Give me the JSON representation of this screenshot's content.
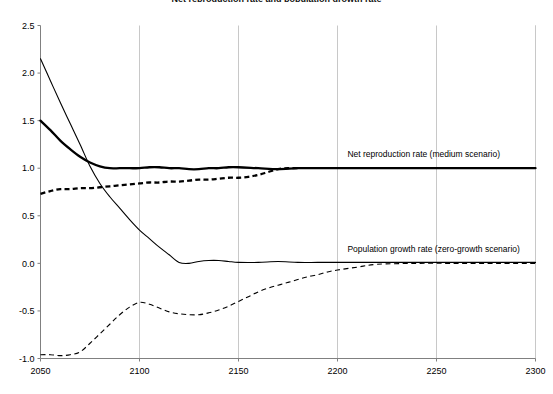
{
  "chart_data": {
    "type": "line",
    "title": "Net reproduction rate and population growth rate",
    "xlabel": "",
    "ylabel": "",
    "xlim": [
      2050,
      2300
    ],
    "ylim": [
      -1.0,
      2.5
    ],
    "xticks": [
      "2050",
      "2100",
      "2150",
      "2200",
      "2250",
      "2300"
    ],
    "xtick_values": [
      2050,
      2100,
      2150,
      2200,
      2250,
      2300
    ],
    "yticks": [
      "2.5",
      "2.0",
      "1.5",
      "1.0",
      "0.5",
      "0.0",
      "-0.5",
      "-1.0"
    ],
    "ytick_values": [
      2.5,
      2.0,
      1.5,
      1.0,
      0.5,
      0.0,
      -0.5,
      -1.0
    ],
    "grid": "vertical",
    "legend": "none",
    "annotations": [
      {
        "name": "net-reproduction-rate-label",
        "text": "Net reproduction rate (medium scenario)",
        "x": 2205,
        "y": 1.12
      },
      {
        "name": "population-growth-rate-label",
        "text": "Population growth rate (zero-growth scenario)",
        "x": 2205,
        "y": 0.12
      }
    ],
    "series": [
      {
        "name": "Net reproduction rate (medium scenario)",
        "style": "solid",
        "width": "thick",
        "color": "#000000",
        "x": [
          2050,
          2055,
          2060,
          2065,
          2070,
          2075,
          2080,
          2085,
          2090,
          2095,
          2100,
          2105,
          2110,
          2115,
          2120,
          2125,
          2130,
          2135,
          2140,
          2145,
          2150,
          2160,
          2170,
          2180,
          2190,
          2200,
          2220,
          2240,
          2260,
          2280,
          2300
        ],
        "values": [
          1.5,
          1.4,
          1.29,
          1.2,
          1.12,
          1.06,
          1.02,
          1.0,
          1.0,
          1.0,
          1.0,
          1.01,
          1.01,
          1.0,
          1.0,
          0.99,
          0.99,
          1.0,
          1.0,
          1.01,
          1.01,
          1.0,
          0.99,
          1.0,
          1.0,
          1.0,
          1.0,
          1.0,
          1.0,
          1.0,
          1.0
        ]
      },
      {
        "name": "Net reproduction rate (zero-growth scenario)",
        "style": "dashed",
        "width": "thick",
        "color": "#000000",
        "x": [
          2050,
          2055,
          2060,
          2065,
          2070,
          2075,
          2080,
          2085,
          2090,
          2095,
          2100,
          2105,
          2110,
          2115,
          2120,
          2125,
          2130,
          2135,
          2140,
          2145,
          2150,
          2155,
          2160,
          2165,
          2170,
          2175,
          2180
        ],
        "values": [
          0.73,
          0.76,
          0.78,
          0.78,
          0.79,
          0.79,
          0.8,
          0.81,
          0.82,
          0.83,
          0.84,
          0.85,
          0.85,
          0.86,
          0.86,
          0.87,
          0.88,
          0.88,
          0.89,
          0.9,
          0.9,
          0.91,
          0.93,
          0.96,
          0.99,
          1.0,
          1.0
        ]
      },
      {
        "name": "Population growth rate (medium scenario)",
        "style": "solid",
        "width": "thin",
        "color": "#000000",
        "x": [
          2050,
          2055,
          2060,
          2065,
          2070,
          2075,
          2080,
          2085,
          2090,
          2095,
          2100,
          2105,
          2110,
          2115,
          2120,
          2125,
          2130,
          2135,
          2140,
          2145,
          2150,
          2160,
          2170,
          2180,
          2190,
          2200,
          2220,
          2240,
          2260,
          2280,
          2300
        ],
        "values": [
          2.15,
          1.92,
          1.69,
          1.47,
          1.25,
          1.02,
          0.84,
          0.7,
          0.58,
          0.46,
          0.35,
          0.26,
          0.17,
          0.09,
          0.01,
          0.0,
          0.02,
          0.03,
          0.03,
          0.02,
          0.01,
          0.01,
          0.02,
          0.01,
          0.01,
          0.01,
          0.01,
          0.01,
          0.01,
          0.01,
          0.01
        ]
      },
      {
        "name": "Population growth rate (zero-growth scenario)",
        "style": "dashed",
        "width": "thin",
        "color": "#000000",
        "x": [
          2050,
          2055,
          2060,
          2065,
          2070,
          2075,
          2080,
          2085,
          2090,
          2095,
          2100,
          2105,
          2110,
          2115,
          2120,
          2125,
          2130,
          2135,
          2140,
          2145,
          2150,
          2155,
          2160,
          2165,
          2170,
          2175,
          2180,
          2185,
          2190,
          2195,
          2200,
          2210,
          2220,
          2240,
          2260,
          2280,
          2300
        ],
        "values": [
          -0.96,
          -0.96,
          -0.97,
          -0.96,
          -0.93,
          -0.84,
          -0.74,
          -0.64,
          -0.54,
          -0.46,
          -0.41,
          -0.43,
          -0.47,
          -0.51,
          -0.53,
          -0.54,
          -0.54,
          -0.52,
          -0.49,
          -0.45,
          -0.4,
          -0.35,
          -0.3,
          -0.26,
          -0.23,
          -0.2,
          -0.17,
          -0.14,
          -0.12,
          -0.09,
          -0.07,
          -0.04,
          -0.01,
          0.0,
          0.0,
          0.0,
          0.0
        ]
      }
    ]
  }
}
